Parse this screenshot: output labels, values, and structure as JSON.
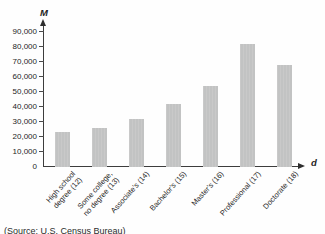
{
  "chart_data": {
    "type": "bar",
    "title": "",
    "ylabel": "M",
    "xlabel": "d",
    "categories": [
      "High school\ndegree (12)",
      "Some college,\nno degree (13)",
      "Associate's (14)",
      "Bachelor's (15)",
      "Master's (16)",
      "Professional (17)",
      "Doctorate (18)"
    ],
    "values": [
      23000,
      26000,
      32000,
      42000,
      54000,
      82000,
      68000
    ],
    "ylim": [
      0,
      90000
    ],
    "ytick_interval": 10000,
    "ytick_labels": [
      "0",
      "10,000",
      "20,000",
      "30,000",
      "40,000",
      "50,000",
      "60,000",
      "70,000",
      "80,000",
      "90,000"
    ],
    "grid": false,
    "legend": false,
    "bar_color": "#c5c5c5",
    "source": "(Source: U.S. Census Bureau)"
  }
}
